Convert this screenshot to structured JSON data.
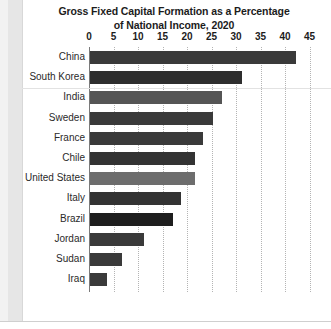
{
  "chart_data": {
    "type": "bar",
    "orientation": "horizontal",
    "title": "Gross Fixed Capital Formation as a Percentage of National Income, 2020",
    "title_line1": "Gross Fixed Capital Formation as a Percentage",
    "title_line2": "of National Income, 2020",
    "xlabel": "",
    "ylabel": "",
    "xlim": [
      0,
      45
    ],
    "xticks": [
      0,
      5,
      10,
      15,
      20,
      25,
      30,
      35,
      40,
      45
    ],
    "xtick_labels": [
      "0",
      "5",
      "10",
      "15",
      "20",
      "25",
      "30",
      "35",
      "40",
      "45"
    ],
    "grid": "vertical-dotted",
    "legend": "none",
    "categories": [
      "China",
      "South Korea",
      "India",
      "Sweden",
      "France",
      "Chile",
      "United States",
      "Italy",
      "Brazil",
      "Jordan",
      "Sudan",
      "Iraq"
    ],
    "values": [
      42.0,
      31.0,
      27.0,
      25.0,
      23.0,
      21.5,
      21.5,
      18.5,
      17.0,
      11.0,
      6.5,
      3.5
    ],
    "bar_colors": [
      "#3a3a3a",
      "#2e2e2e",
      "#555555",
      "#3a3a3a",
      "#3a3a3a",
      "#333333",
      "#6d6d6d",
      "#333333",
      "#1e1e1e",
      "#3a3a3a",
      "#3a3a3a",
      "#3a3a3a"
    ]
  },
  "colors": {
    "axis": "#7a7a7a",
    "grid": "#b4b4b4",
    "text": "#1c1c1c",
    "background": "#ffffff",
    "page_margin": "#e6e6e6"
  }
}
